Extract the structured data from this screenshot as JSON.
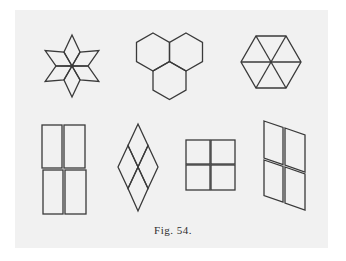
{
  "figure": {
    "caption": "Fig. 54.",
    "line_color": "#3a3a3a",
    "background_color": "#f1f1f1",
    "panels": [
      {
        "name": "six-rhombus-star",
        "description": "six rhombi forming a star"
      },
      {
        "name": "three-hexagon-cluster",
        "description": "three hexagons meeting at a point"
      },
      {
        "name": "hexagon-six-triangles",
        "description": "hexagon divided into six triangles"
      },
      {
        "name": "four-tall-rectangles",
        "description": "four rectangles in a 2x2 grid"
      },
      {
        "name": "four-rhombus-diamond",
        "description": "four rhombi forming a large rhombus"
      },
      {
        "name": "four-squares",
        "description": "four squares in a 2x2 grid"
      },
      {
        "name": "four-parallelograms",
        "description": "four parallelograms forming a sheared grid"
      }
    ]
  }
}
